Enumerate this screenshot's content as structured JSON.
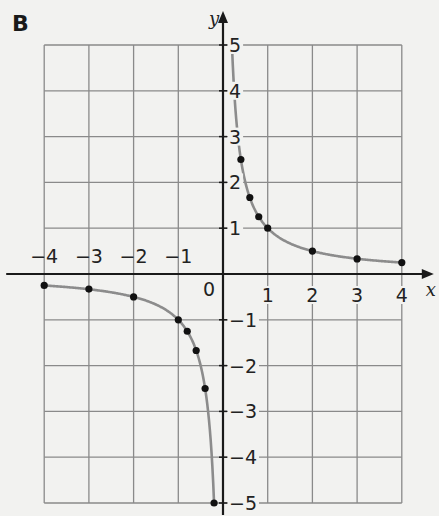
{
  "panel_label": "B",
  "chart_data": {
    "type": "line",
    "title": "",
    "function": "y = 1/x",
    "xlabel": "x",
    "ylabel": "y",
    "xlim": [
      -4,
      4
    ],
    "ylim": [
      -5,
      5
    ],
    "grid": true,
    "x_ticks": [
      -4,
      -3,
      -2,
      -1,
      1,
      2,
      3,
      4
    ],
    "y_ticks": [
      -5,
      -4,
      -3,
      -2,
      -1,
      1,
      2,
      3,
      4,
      5
    ],
    "origin_label": "0",
    "series": [
      {
        "name": "y = 1/x (x > 0)",
        "points": [
          [
            0.2,
            5
          ],
          [
            0.4,
            2.5
          ],
          [
            0.6,
            1.67
          ],
          [
            0.8,
            1.25
          ],
          [
            1,
            1
          ],
          [
            2,
            0.5
          ],
          [
            3,
            0.33
          ],
          [
            4,
            0.25
          ]
        ]
      },
      {
        "name": "y = 1/x (x < 0)",
        "points": [
          [
            -4,
            -0.25
          ],
          [
            -3,
            -0.33
          ],
          [
            -2,
            -0.5
          ],
          [
            -1,
            -1
          ],
          [
            -0.8,
            -1.25
          ],
          [
            -0.6,
            -1.67
          ],
          [
            -0.4,
            -2.5
          ],
          [
            -0.2,
            -5
          ]
        ]
      }
    ]
  }
}
